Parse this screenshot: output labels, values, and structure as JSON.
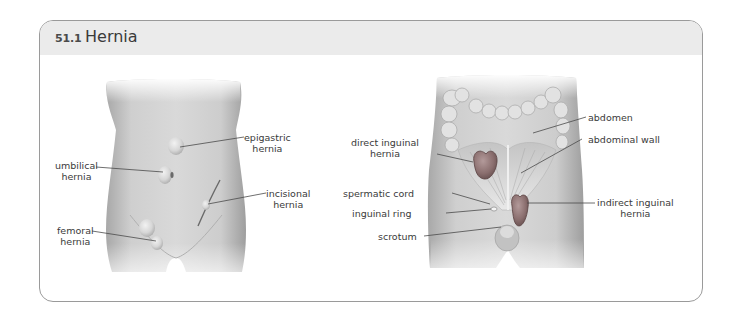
{
  "figure": {
    "number": "51.1",
    "title": "Hernia"
  },
  "left_diagram": {
    "name": "external-torso",
    "labels": {
      "epigastric": [
        "epigastric",
        "hernia"
      ],
      "umbilical": [
        "umbilical",
        "hernia"
      ],
      "incisional": [
        "incisional",
        "hernia"
      ],
      "femoral": [
        "femoral",
        "hernia"
      ]
    }
  },
  "right_diagram": {
    "name": "internal-inguinal-view",
    "labels": {
      "abdomen": "abdomen",
      "abdominal_wall": "abdominal wall",
      "direct_inguinal": [
        "direct inguinal",
        "hernia"
      ],
      "spermatic_cord": "spermatic cord",
      "inguinal_ring": "inguinal ring",
      "indirect_inguinal": [
        "indirect inguinal",
        "hernia"
      ],
      "scrotum": "scrotum"
    }
  },
  "colors": {
    "panel_border": "#9a9a9a",
    "title_band": "#ebebeb",
    "skin_light": "#e6e6e6",
    "skin_dark": "#9c9c9c",
    "hernia_sac": "#8a6e6e",
    "leader_line": "#4a4a4a"
  }
}
